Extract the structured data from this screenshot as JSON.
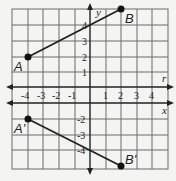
{
  "diagram": {
    "type": "coordinate-grid-reflection",
    "grid": {
      "xmin": -5,
      "xmax": 5,
      "ymin": -5,
      "ymax": 5
    },
    "axes": {
      "x_label": "x",
      "y_label": "y",
      "x_axis_at_y": -1
    },
    "reflection_line": {
      "label": "r",
      "y": 0
    },
    "x_ticks": [
      "-4",
      "-3",
      "-2",
      "-1",
      "1",
      "2",
      "3",
      "4"
    ],
    "y_ticks_pos": [
      "1",
      "2",
      "3",
      "4"
    ],
    "y_ticks_neg": [
      "-2",
      "-3",
      "-4"
    ],
    "points": {
      "A": {
        "label": "A",
        "x": -4,
        "y": 2
      },
      "B": {
        "label": "B",
        "x": 2,
        "y": 5
      },
      "A_prime": {
        "label": "A'",
        "x": -4,
        "y": -2
      },
      "B_prime": {
        "label": "B'",
        "x": 2,
        "y": -5
      }
    },
    "segments": [
      [
        "A",
        "B"
      ],
      [
        "A_prime",
        "B_prime"
      ]
    ],
    "colors": {
      "grid": "#555555",
      "axis": "#222222",
      "background": "#f4f4f2"
    }
  }
}
